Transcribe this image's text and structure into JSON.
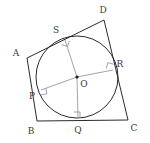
{
  "figure": {
    "canvas": {
      "width": 150,
      "height": 143,
      "background": "#ffffff"
    },
    "colors": {
      "quadrilateral_stroke": "#2b2b2b",
      "circle_stroke": "#2b2b2b",
      "radius_stroke": "#9a9a9a",
      "right_angle_stroke": "#9a9a9a",
      "center_dot": "#1a1a1a",
      "label_text": "#3a3a3a"
    },
    "quadrilateral": {
      "name": "ABCD",
      "vertices": [
        {
          "id": "A",
          "label": "A",
          "x": 27,
          "y": 58,
          "label_x": 16,
          "label_y": 53
        },
        {
          "id": "B",
          "label": "B",
          "x": 37,
          "y": 121,
          "label_x": 31,
          "label_y": 131
        },
        {
          "id": "C",
          "label": "C",
          "x": 128,
          "y": 120,
          "label_x": 134,
          "label_y": 128
        },
        {
          "id": "D",
          "label": "D",
          "x": 104,
          "y": 20,
          "label_x": 103,
          "label_y": 10
        }
      ],
      "edges": [
        {
          "id": "AB",
          "from": "A",
          "to": "B"
        },
        {
          "id": "BC",
          "from": "B",
          "to": "C"
        },
        {
          "id": "CD",
          "from": "C",
          "to": "D"
        },
        {
          "id": "DA",
          "from": "D",
          "to": "A"
        }
      ]
    },
    "circle": {
      "center": {
        "id": "O",
        "label": "O",
        "x": 77,
        "y": 77,
        "label_x": 84,
        "label_y": 84
      },
      "radius": 41
    },
    "tangent_points": [
      {
        "id": "P",
        "label": "P",
        "x": 41,
        "y": 90,
        "label_x": 32,
        "label_y": 96,
        "on_edge": "AB"
      },
      {
        "id": "Q",
        "label": "Q",
        "x": 78,
        "y": 118,
        "label_x": 78,
        "label_y": 130,
        "on_edge": "BC"
      },
      {
        "id": "R",
        "label": "R",
        "x": 113,
        "y": 70,
        "label_x": 120,
        "label_y": 64,
        "on_edge": "CD"
      },
      {
        "id": "S",
        "label": "S",
        "x": 64,
        "y": 37,
        "label_x": 56,
        "label_y": 30,
        "on_edge": "DA"
      }
    ],
    "radii": [
      {
        "id": "OP",
        "from": "O",
        "to": "P"
      },
      {
        "id": "OQ",
        "from": "O",
        "to": "Q"
      },
      {
        "id": "OR",
        "from": "O",
        "to": "R"
      },
      {
        "id": "OS",
        "from": "O",
        "to": "S"
      }
    ],
    "right_angle_marks": [
      {
        "id": "right-angle-at-P",
        "at": "P",
        "size": 6
      },
      {
        "id": "right-angle-at-Q",
        "at": "Q",
        "size": 6
      },
      {
        "id": "right-angle-at-R",
        "at": "R",
        "size": 6
      },
      {
        "id": "right-angle-at-S",
        "at": "S",
        "size": 6
      }
    ]
  }
}
